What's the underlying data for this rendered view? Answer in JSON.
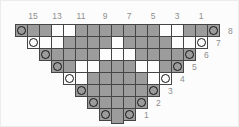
{
  "chart": {
    "type": "knitting_lace_chart",
    "column_labels": [
      "15",
      "13",
      "11",
      "9",
      "7",
      "5",
      "3",
      "1"
    ],
    "row_labels": [
      "8",
      "7",
      "6",
      "5",
      "4",
      "3",
      "2",
      "1"
    ],
    "legend": {
      "OF": "yarn-over circle on gray stitch",
      "OE": "yarn-over circle on white stitch",
      "F": "gray stitch",
      "E": "white stitch"
    },
    "colors": {
      "filled": "#9c9c9c",
      "empty": "#fdfdfd",
      "grid_line": "#454545",
      "circle": "#141414",
      "label_text": "#8e8e8e",
      "background": "#fcfcfc"
    },
    "rows": [
      {
        "row": "8",
        "offset": 0,
        "cells": [
          "OF",
          "F",
          "F",
          "E",
          "E",
          "F",
          "F",
          "F",
          "F",
          "F",
          "F",
          "F",
          "E",
          "E",
          "F",
          "F",
          "OF"
        ]
      },
      {
        "row": "7",
        "offset": 1,
        "cells": [
          "OE",
          "E",
          "E",
          "F",
          "F",
          "F",
          "F",
          "E",
          "F",
          "F",
          "F",
          "F",
          "E",
          "E",
          "OE"
        ]
      },
      {
        "row": "6",
        "offset": 2,
        "cells": [
          "OF",
          "F",
          "F",
          "F",
          "F",
          "E",
          "E",
          "E",
          "F",
          "F",
          "F",
          "F",
          "OF"
        ]
      },
      {
        "row": "5",
        "offset": 3,
        "cells": [
          "OF",
          "F",
          "E",
          "E",
          "F",
          "F",
          "F",
          "E",
          "E",
          "F",
          "OF"
        ]
      },
      {
        "row": "4",
        "offset": 4,
        "cells": [
          "OE",
          "E",
          "F",
          "F",
          "F",
          "F",
          "F",
          "E",
          "OE"
        ]
      },
      {
        "row": "3",
        "offset": 5,
        "cells": [
          "OF",
          "F",
          "F",
          "F",
          "F",
          "F",
          "OF"
        ]
      },
      {
        "row": "2",
        "offset": 6,
        "cells": [
          "OF",
          "F",
          "F",
          "F",
          "OF"
        ]
      },
      {
        "row": "1",
        "offset": 7,
        "cells": [
          "OF",
          "F",
          "OF"
        ]
      }
    ],
    "center_cast_on_tab": true,
    "grid_columns": 17
  }
}
